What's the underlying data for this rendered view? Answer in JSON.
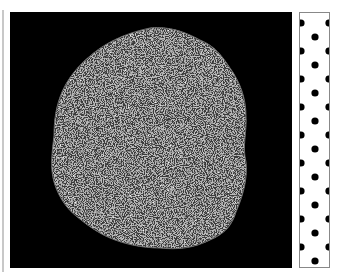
{
  "figure": {
    "background_color": "#000000",
    "specimen_base_color": "#3a3a3a",
    "specimen_grain_light": "#d8d8d8",
    "specimen_grain_dark": "#1a1a1a"
  },
  "scale_strip": {
    "pattern": "staggered black dots",
    "dot_color": "#000000",
    "strip_color": "#ffffff",
    "dot_spacing_px": 14
  }
}
